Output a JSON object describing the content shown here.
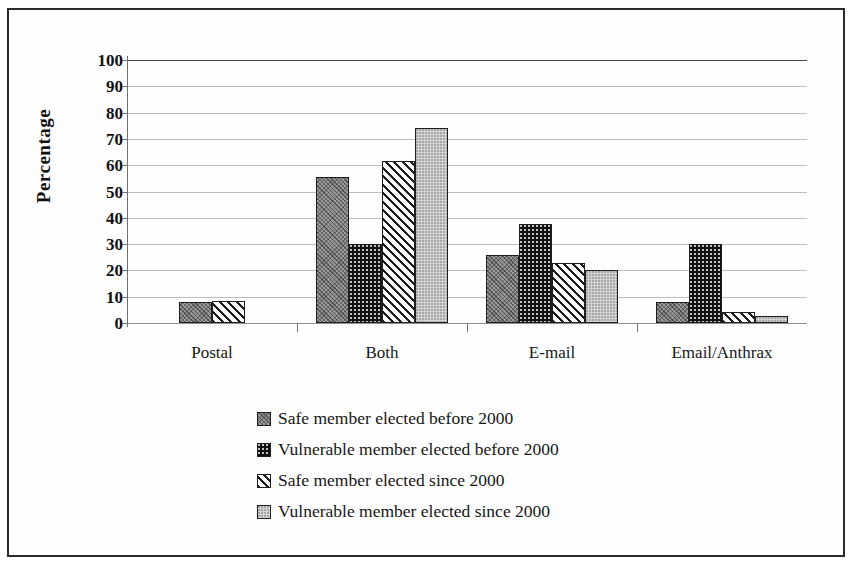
{
  "chart_data": {
    "type": "bar",
    "title": "",
    "xlabel": "",
    "ylabel": "Percentage",
    "ylim": [
      0,
      100
    ],
    "ytick_step": 10,
    "yticks": [
      "100",
      "90",
      "80",
      "70",
      "60",
      "50",
      "40",
      "30",
      "20",
      "10",
      "0"
    ],
    "grid": true,
    "legend_position": "bottom-center",
    "categories": [
      "Postal",
      "Both",
      "E-mail",
      "Email/Anthrax"
    ],
    "series": [
      {
        "name": "Safe member elected before 2000",
        "pattern": "dark-gray-crosshatch",
        "values": [
          8,
          55.5,
          26,
          8
        ]
      },
      {
        "name": "Vulnerable member elected before 2000",
        "pattern": "black-speckle",
        "values": [
          0,
          30,
          37.5,
          30
        ]
      },
      {
        "name": "Safe member elected since 2000",
        "pattern": "white-diagonal-stripe",
        "values": [
          8.5,
          61.5,
          23,
          4
        ]
      },
      {
        "name": "Vulnerable member elected since 2000",
        "pattern": "light-gray-solid",
        "values": [
          0,
          74,
          20,
          2.5
        ]
      }
    ]
  },
  "colors": {
    "frame": "#2b2b2b",
    "gridline": "#b9bdc6",
    "axis": "#6e7077",
    "bar_outline": "#1f1f1f",
    "series_1": "#9a9a9a",
    "series_2": "#121212",
    "series_3": "#ffffff",
    "series_4": "#d4d4d4",
    "background": "#ffffff"
  }
}
